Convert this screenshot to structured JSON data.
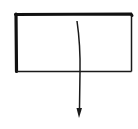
{
  "diagram": {
    "background": "#ffffff",
    "stroke_color": "#1a1a1a",
    "box": {
      "x": 16,
      "y": 14,
      "width": 116,
      "height": 58
    },
    "arrow": {
      "start": [
        77,
        21
      ],
      "end": [
        79,
        116
      ],
      "direction": "down"
    }
  }
}
